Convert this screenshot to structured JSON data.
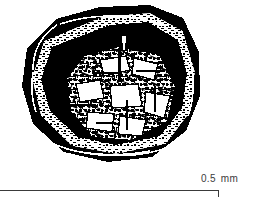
{
  "figure": {
    "kind": "scientific-illustration",
    "rendering": "black-and-white line/halftone micrograph drawing",
    "background_color": "#ffffff",
    "ink_color": "#000000",
    "specimen": {
      "outline_shape": "hexagonal",
      "bounds_px": {
        "x": 22,
        "y": 5,
        "width": 178,
        "height": 157
      },
      "features": [
        {
          "name": "outer-wall",
          "description": "thick solid black hexagonal rim"
        },
        {
          "name": "outer-speckled-band",
          "description": "light granular band inside the outer rim"
        },
        {
          "name": "inner-dark-ring",
          "description": "second black ring surrounding the core"
        },
        {
          "name": "crystalline-core",
          "description": "granular mosaic of angular crystal fragments"
        },
        {
          "name": "top-notch",
          "description": "cleft / re-entrant notch at top centre of wall"
        }
      ]
    }
  },
  "scalebar": {
    "value": "0.5",
    "unit": "mm",
    "line_color": "#3a3a3a",
    "length_px": 219,
    "tick_side": "right"
  }
}
